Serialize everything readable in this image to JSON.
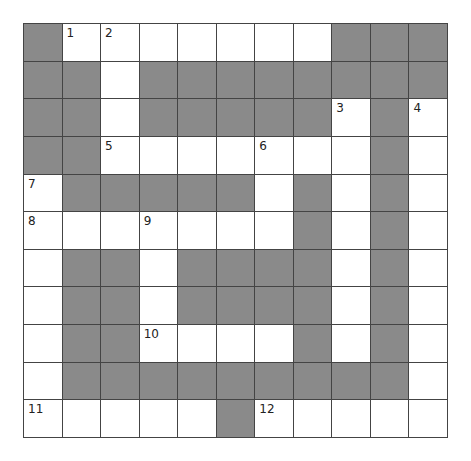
{
  "puzzle": {
    "rows": 11,
    "cols": 11,
    "colors": {
      "block": "#8a8a8a",
      "open": "#ffffff",
      "line": "#444444"
    },
    "layout": [
      "B12WWWWWBBB",
      "BBWBBBBBBBB",
      "BBWBBBBB3B4",
      "BB5WWW6WWBW",
      "7BBBBBWBWBW",
      "8WW9WWWBWBW",
      "WBBWBBBBWBW",
      "WBBWBBBBWBW",
      "WBB0WWWBWBW",
      "WBBBBBBBBBW",
      "1WWWWB2WWWW"
    ],
    "numbers": [
      {
        "row": 0,
        "col": 1,
        "label": "1"
      },
      {
        "row": 0,
        "col": 2,
        "label": "2"
      },
      {
        "row": 2,
        "col": 8,
        "label": "3"
      },
      {
        "row": 2,
        "col": 10,
        "label": "4"
      },
      {
        "row": 3,
        "col": 2,
        "label": "5"
      },
      {
        "row": 3,
        "col": 6,
        "label": "6"
      },
      {
        "row": 4,
        "col": 0,
        "label": "7"
      },
      {
        "row": 5,
        "col": 0,
        "label": "8"
      },
      {
        "row": 5,
        "col": 3,
        "label": "9"
      },
      {
        "row": 8,
        "col": 3,
        "label": "10"
      },
      {
        "row": 10,
        "col": 0,
        "label": "11"
      },
      {
        "row": 10,
        "col": 6,
        "label": "12"
      }
    ],
    "blocks": [
      [
        0,
        0
      ],
      [
        0,
        8
      ],
      [
        0,
        9
      ],
      [
        0,
        10
      ],
      [
        1,
        0
      ],
      [
        1,
        1
      ],
      [
        1,
        3
      ],
      [
        1,
        4
      ],
      [
        1,
        5
      ],
      [
        1,
        6
      ],
      [
        1,
        7
      ],
      [
        1,
        8
      ],
      [
        1,
        9
      ],
      [
        1,
        10
      ],
      [
        2,
        0
      ],
      [
        2,
        1
      ],
      [
        2,
        3
      ],
      [
        2,
        4
      ],
      [
        2,
        5
      ],
      [
        2,
        6
      ],
      [
        2,
        7
      ],
      [
        2,
        9
      ],
      [
        3,
        0
      ],
      [
        3,
        1
      ],
      [
        3,
        9
      ],
      [
        4,
        1
      ],
      [
        4,
        2
      ],
      [
        4,
        3
      ],
      [
        4,
        4
      ],
      [
        4,
        5
      ],
      [
        4,
        7
      ],
      [
        4,
        9
      ],
      [
        5,
        7
      ],
      [
        5,
        9
      ],
      [
        6,
        1
      ],
      [
        6,
        2
      ],
      [
        6,
        4
      ],
      [
        6,
        5
      ],
      [
        6,
        6
      ],
      [
        6,
        7
      ],
      [
        6,
        9
      ],
      [
        7,
        1
      ],
      [
        7,
        2
      ],
      [
        7,
        4
      ],
      [
        7,
        5
      ],
      [
        7,
        6
      ],
      [
        7,
        7
      ],
      [
        7,
        9
      ],
      [
        8,
        1
      ],
      [
        8,
        2
      ],
      [
        8,
        7
      ],
      [
        8,
        9
      ],
      [
        9,
        1
      ],
      [
        9,
        2
      ],
      [
        9,
        3
      ],
      [
        9,
        4
      ],
      [
        9,
        5
      ],
      [
        9,
        6
      ],
      [
        9,
        7
      ],
      [
        9,
        8
      ],
      [
        9,
        9
      ],
      [
        10,
        5
      ]
    ]
  }
}
